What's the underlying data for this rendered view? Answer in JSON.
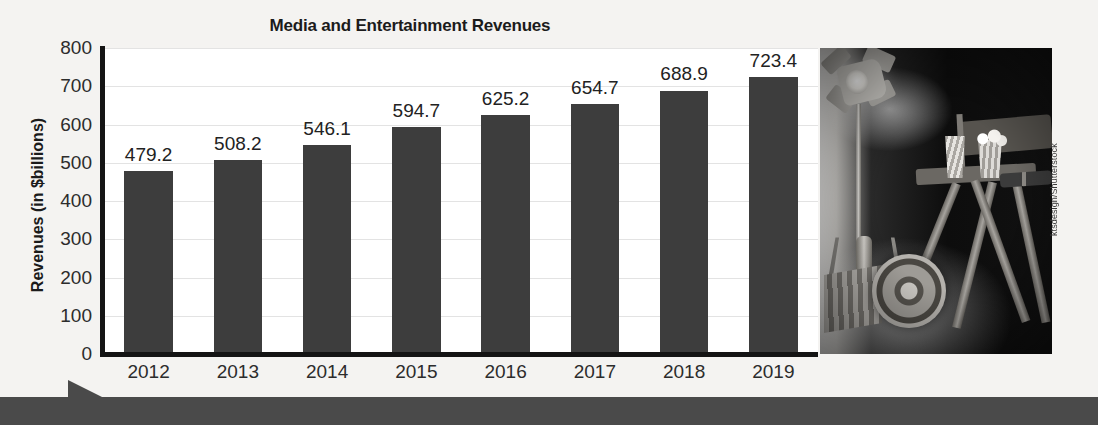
{
  "chart_data": {
    "type": "bar",
    "title": "Media and Entertainment Revenues",
    "xlabel": "",
    "ylabel": "Revenues (in $billions)",
    "categories": [
      "2012",
      "2013",
      "2014",
      "2015",
      "2016",
      "2017",
      "2018",
      "2019"
    ],
    "values": [
      479.2,
      508.2,
      546.1,
      594.7,
      625.2,
      654.7,
      688.9,
      723.4
    ],
    "value_labels": [
      "479.2",
      "508.2",
      "546.1",
      "594.7",
      "625.2",
      "654.7",
      "688.9",
      "723.4"
    ],
    "ylim": [
      0,
      800
    ],
    "yticks": [
      0,
      100,
      200,
      300,
      400,
      500,
      600,
      700,
      800
    ],
    "ytick_labels": [
      "0",
      "100",
      "200",
      "300",
      "400",
      "500",
      "600",
      "700",
      "800"
    ],
    "grid": true,
    "legend": "none",
    "bar_color": "#3d3d3d",
    "plot_background": "#ffffff",
    "page_background": "#f4f3f1"
  },
  "photo": {
    "credit": "ktsdesign/Shutterstock",
    "description": "film-set-photo"
  }
}
